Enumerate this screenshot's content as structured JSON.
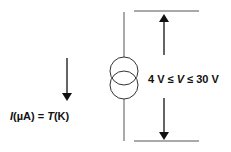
{
  "diagram": {
    "type": "current-source-symbol",
    "current_label": {
      "prefix": "I",
      "unit": "(µA) = ",
      "var": "T",
      "unit2": "(K)"
    },
    "voltage_label": {
      "left": "4 V ≤ ",
      "var": "V",
      "right": " ≤ 30 V"
    },
    "colors": {
      "stroke": "#111111",
      "wire": "#555555"
    }
  }
}
